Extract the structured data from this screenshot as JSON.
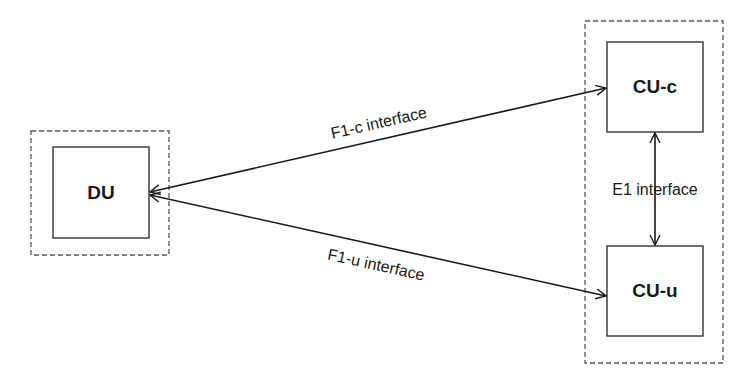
{
  "diagram": {
    "nodes": {
      "du": {
        "label": "DU"
      },
      "cu_c": {
        "label": "CU-c"
      },
      "cu_u": {
        "label": "CU-u"
      }
    },
    "interfaces": {
      "f1c": {
        "label": "F1-c interface",
        "from": "DU",
        "to": "CU-c",
        "direction": "bidirectional"
      },
      "f1u": {
        "label": "F1-u interface",
        "from": "DU",
        "to": "CU-u",
        "direction": "bidirectional"
      },
      "e1": {
        "label": "E1 interface",
        "from": "CU-c",
        "to": "CU-u",
        "direction": "bidirectional"
      }
    },
    "groups": {
      "du_group": {
        "contains": [
          "DU"
        ],
        "style": "dashed"
      },
      "cu_group": {
        "contains": [
          "CU-c",
          "CU-u"
        ],
        "style": "dashed"
      }
    },
    "colors": {
      "line": "#1a1a1a",
      "dashed": "#555555",
      "background": "#ffffff"
    }
  }
}
